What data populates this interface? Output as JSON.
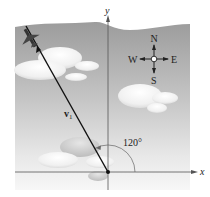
{
  "diagram": {
    "axes": {
      "x_label": "x",
      "y_label": "y"
    },
    "vector": {
      "label_main": "v",
      "label_sub": "1",
      "angle_label": "120°"
    },
    "compass": {
      "north": "N",
      "south": "S",
      "east": "E",
      "west": "W"
    },
    "colors": {
      "sky_top": "#9a9a9a",
      "sky_bottom": "#f2f2f2",
      "line": "#111111",
      "axis": "#444444"
    }
  }
}
